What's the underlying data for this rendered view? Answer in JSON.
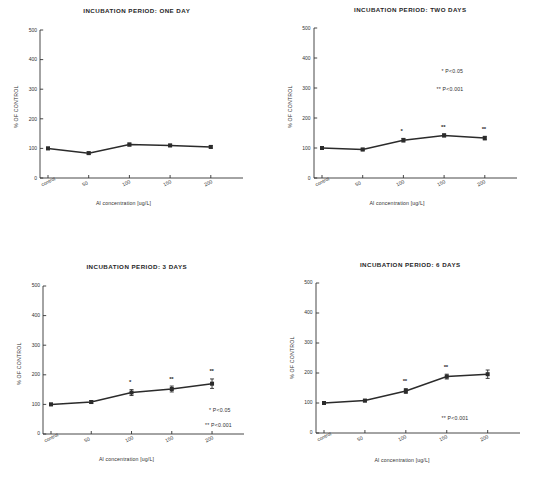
{
  "figure": {
    "axis_label_y": "% OF CONTROL",
    "axis_label_x": "Al concentration [ug/L]",
    "y_ticks": [
      "0",
      "100",
      "200",
      "300",
      "400",
      "500"
    ],
    "x_ticks": [
      "control",
      "50",
      "100",
      "150",
      "200"
    ],
    "sig_note_1": "* P<0.05",
    "sig_note_2": "** P<0.001"
  },
  "chart_data": [
    {
      "type": "line",
      "title": "INCUBATION PERIOD: ONE DAY",
      "xlabel": "Al concentration [ug/L]",
      "ylabel": "% OF CONTROL",
      "categories": [
        "control",
        "50",
        "100",
        "150",
        "200"
      ],
      "x": [
        0,
        50,
        100,
        150,
        200
      ],
      "values": [
        100,
        84,
        113,
        110,
        105
      ],
      "errors": [
        4,
        4,
        5,
        4,
        4
      ],
      "significance": [
        "",
        "",
        "",
        "",
        ""
      ],
      "annotations": [],
      "ylim": [
        0,
        500
      ],
      "yticks": [
        0,
        100,
        200,
        300,
        400,
        500
      ],
      "grid": false,
      "legend": "none"
    },
    {
      "type": "line",
      "title": "INCUBATION PERIOD: TWO DAYS",
      "xlabel": "Al concentration [ug/L]",
      "ylabel": "% OF CONTROL",
      "categories": [
        "control",
        "50",
        "100",
        "150",
        "200"
      ],
      "x": [
        0,
        50,
        100,
        150,
        200
      ],
      "values": [
        100,
        95,
        126,
        142,
        133
      ],
      "errors": [
        4,
        4,
        6,
        5,
        6
      ],
      "significance": [
        "",
        "",
        "*",
        "**",
        "**"
      ],
      "annotations": [
        "* P<0.05",
        "** P<0.001"
      ],
      "ylim": [
        0,
        500
      ],
      "yticks": [
        0,
        100,
        200,
        300,
        400,
        500
      ],
      "grid": false,
      "legend": "none"
    },
    {
      "type": "line",
      "title": "INCUBATION PERIOD: 3 DAYS",
      "xlabel": "Al concentration [ug/L]",
      "ylabel": "% OF CONTROL",
      "categories": [
        "control",
        "50",
        "100",
        "150",
        "200"
      ],
      "x": [
        0,
        50,
        100,
        150,
        200
      ],
      "values": [
        100,
        108,
        140,
        152,
        170
      ],
      "errors": [
        4,
        5,
        10,
        10,
        16
      ],
      "significance": [
        "",
        "",
        "*",
        "**",
        "**"
      ],
      "annotations": [
        "* P<0.05",
        "** P<0.001"
      ],
      "ylim": [
        0,
        500
      ],
      "yticks": [
        0,
        100,
        200,
        300,
        400,
        500
      ],
      "grid": false,
      "legend": "none"
    },
    {
      "type": "line",
      "title": "INCUBATION PERIOD: 6 DAYS",
      "xlabel": "Al concentration [ug/L]",
      "ylabel": "% OF CONTROL",
      "categories": [
        "control",
        "50",
        "100",
        "150",
        "200"
      ],
      "x": [
        0,
        50,
        100,
        150,
        200
      ],
      "values": [
        100,
        108,
        140,
        188,
        196
      ],
      "errors": [
        3,
        4,
        8,
        8,
        14
      ],
      "significance": [
        "",
        "",
        "**",
        "**",
        ""
      ],
      "annotations": [
        "** P<0.001"
      ],
      "ylim": [
        0,
        500
      ],
      "yticks": [
        0,
        100,
        200,
        300,
        400,
        500
      ],
      "grid": false,
      "legend": "none"
    }
  ]
}
